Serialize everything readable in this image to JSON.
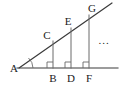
{
  "figure": {
    "type": "geometry-diagram",
    "width": 119,
    "height": 85,
    "background_color": "#ffffff",
    "stroke_color": "#3a3a3a",
    "label_color": "#1a1a1a",
    "ellipsis": "...",
    "vertices": [
      {
        "id": "A",
        "label": "A",
        "label_x": 14,
        "label_y": 68,
        "point_x": 19,
        "point_y": 68,
        "role": "apex-left"
      },
      {
        "id": "B",
        "label": "B",
        "label_x": 53,
        "label_y": 78,
        "point_x": 53,
        "point_y": 68,
        "role": "base-foot"
      },
      {
        "id": "C",
        "label": "C",
        "label_x": 47,
        "label_y": 35,
        "point_x": 53,
        "point_y": 41,
        "role": "ray-point"
      },
      {
        "id": "D",
        "label": "D",
        "label_x": 71,
        "label_y": 78,
        "point_x": 71,
        "point_y": 68,
        "role": "base-foot"
      },
      {
        "id": "E",
        "label": "E",
        "label_x": 68,
        "label_y": 21,
        "point_x": 71,
        "point_y": 28,
        "role": "ray-point"
      },
      {
        "id": "F",
        "label": "F",
        "label_x": 89,
        "label_y": 78,
        "point_x": 89,
        "point_y": 68,
        "role": "base-foot"
      },
      {
        "id": "G",
        "label": "G",
        "label_x": 92,
        "label_y": 8,
        "point_x": 89,
        "point_y": 15,
        "role": "ray-point"
      }
    ],
    "segments": [
      {
        "name": "base-line",
        "x1": 17,
        "y1": 68,
        "x2": 118,
        "y2": 68
      },
      {
        "name": "ray-AG",
        "x1": 19,
        "y1": 68,
        "x2": 112,
        "y2": 3
      },
      {
        "name": "perpendicular-CB",
        "x1": 53,
        "y1": 41,
        "x2": 53,
        "y2": 68
      },
      {
        "name": "perpendicular-ED",
        "x1": 71,
        "y1": 28,
        "x2": 71,
        "y2": 68
      },
      {
        "name": "perpendicular-GF",
        "x1": 89,
        "y1": 15,
        "x2": 89,
        "y2": 68
      }
    ],
    "right_angle_markers": [
      {
        "at": "B",
        "x": 53,
        "y": 68,
        "size": 6
      },
      {
        "at": "D",
        "x": 71,
        "y": 68,
        "size": 6
      },
      {
        "at": "F",
        "x": 89,
        "y": 68,
        "size": 6
      }
    ],
    "angle_marker": {
      "at": "A",
      "x": 19,
      "y": 68,
      "radius": 12
    },
    "ellipsis_marker": {
      "text": "...",
      "x": 104,
      "y": 40
    }
  }
}
